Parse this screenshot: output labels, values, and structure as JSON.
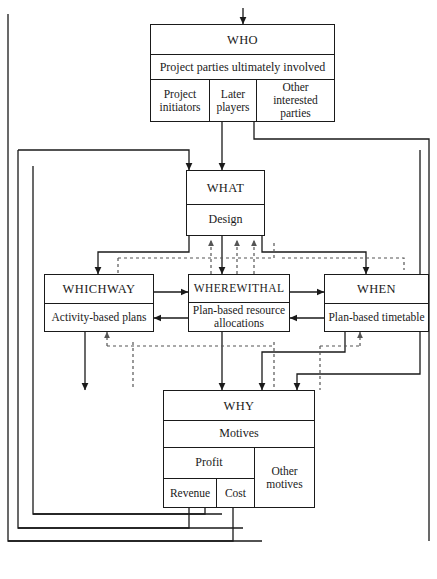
{
  "diagram": {
    "title_hidden": "Project definition framework",
    "boxes": {
      "who": {
        "title": "WHO",
        "subtitle": "Project parties ultimately involved",
        "parts": [
          "Project initiators",
          "Later players",
          "Other interested parties"
        ]
      },
      "what": {
        "title": "WHAT",
        "subtitle": "Design"
      },
      "whichway": {
        "title": "WHICHWAY",
        "subtitle": "Activity-based plans"
      },
      "wherewithal": {
        "title": "WHEREWITHAL",
        "subtitle": "Plan-based resource allocations"
      },
      "when": {
        "title": "WHEN",
        "subtitle": "Plan-based timetable"
      },
      "why": {
        "title": "WHY",
        "subtitle": "Motives",
        "profit": "Profit",
        "revenue": "Revenue",
        "cost": "Cost",
        "other_motives": "Other motives"
      }
    },
    "colors": {
      "line": "#1a1a1a",
      "background": "#ffffff"
    },
    "caption": ""
  }
}
